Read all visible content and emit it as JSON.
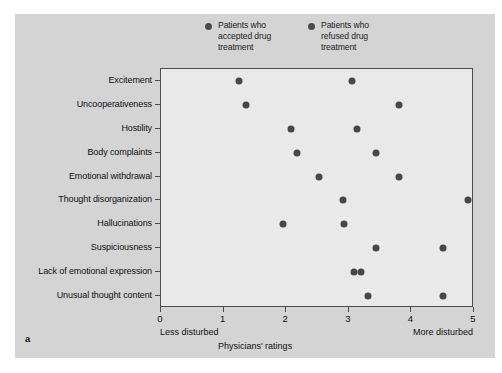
{
  "figure": {
    "panel_letter": "a",
    "background_color": "#d4d4d4",
    "plot_background_color": "#e9e9e9",
    "marker_color": "#474747"
  },
  "legend": {
    "items": [
      {
        "label": "Patients who\naccepted drug\ntreatment",
        "marker": "dot",
        "color": "#4a4a4a"
      },
      {
        "label": "Patients who\nrefused drug\ntreatment",
        "marker": "dot",
        "color": "#4a4a4a"
      }
    ]
  },
  "axis": {
    "x_title": "Physicians' ratings",
    "x_low_label": "Less disturbed",
    "x_high_label": "More disturbed",
    "x_ticklabels": [
      "0",
      "1",
      "2",
      "3",
      "4",
      "5"
    ]
  },
  "chart_data": {
    "type": "scatter",
    "title": "",
    "xlabel": "Physicians' ratings",
    "ylabel": "",
    "xlim": [
      0,
      5
    ],
    "grid": false,
    "legend_position": "top-center",
    "annotations": [
      "Less disturbed",
      "More disturbed",
      "a"
    ],
    "categories": [
      "Excitement",
      "Uncooperativeness",
      "Hostility",
      "Body complaints",
      "Emotional withdrawal",
      "Thought disorganization",
      "Hallucinations",
      "Suspiciousness",
      "Lack of emotional expression",
      "Unusual thought content"
    ],
    "series": [
      {
        "name": "Patients who accepted drug treatment",
        "color": "#474747",
        "values": [
          1.25,
          1.35,
          2.07,
          2.18,
          2.52,
          2.9,
          1.95,
          3.43,
          3.08,
          3.3
        ]
      },
      {
        "name": "Patients who refused drug treatment",
        "color": "#474747",
        "values": [
          3.05,
          3.8,
          3.13,
          3.43,
          3.8,
          4.9,
          2.93,
          4.5,
          3.2,
          4.5
        ]
      }
    ]
  }
}
